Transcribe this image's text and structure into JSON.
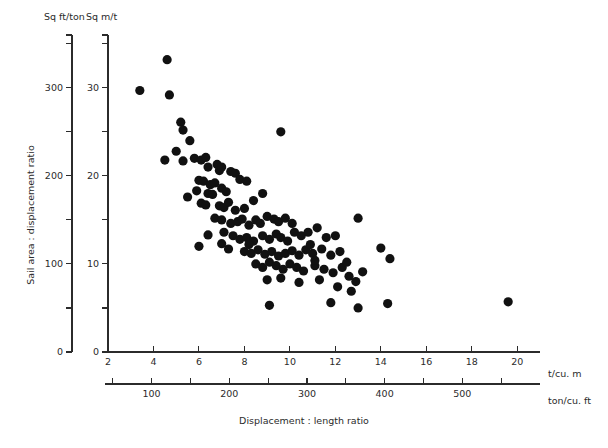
{
  "chart_data": {
    "type": "scatter",
    "title": "",
    "xlabel": "Displacement : length ratio",
    "ylabel": "Sail area : displacement ratio",
    "x_axis_primary": {
      "unit_label": "t/cu. m",
      "ticks": [
        2,
        4,
        6,
        8,
        10,
        12,
        14,
        16,
        18,
        20
      ],
      "tick_labels": [
        "2",
        "4",
        "6",
        "8",
        "10",
        "12",
        "14",
        "16",
        "18",
        "20"
      ],
      "range": [
        2,
        21
      ]
    },
    "x_axis_secondary": {
      "unit_label": "ton/cu. ft",
      "ticks": [
        100,
        200,
        300,
        400,
        500
      ],
      "tick_labels": [
        "100",
        "200",
        "300",
        "400",
        "500"
      ],
      "minor_ticks": [
        50,
        150,
        250,
        350,
        450,
        550
      ]
    },
    "y_axis_primary": {
      "unit_label": "Sq ft/ton",
      "ticks": [
        0,
        100,
        200,
        300
      ],
      "tick_labels": [
        "0",
        "100",
        "200",
        "300"
      ],
      "minor_ticks": [
        50,
        150,
        250,
        350
      ],
      "range": [
        0,
        360
      ]
    },
    "y_axis_secondary": {
      "unit_label": "Sq m/t",
      "ticks": [
        0,
        10,
        20,
        30
      ],
      "tick_labels": [
        "0",
        "10",
        "20",
        "30"
      ],
      "minor_ticks": [
        5,
        15,
        25,
        35
      ],
      "range": [
        0,
        36
      ]
    },
    "grid": false,
    "legend": null,
    "marker": {
      "shape": "circle",
      "color": "#111111",
      "size": 5.4
    },
    "series": [
      {
        "name": "Yachts",
        "points": [
          [
            3.4,
            29.7
          ],
          [
            4.6,
            33.2
          ],
          [
            4.7,
            29.2
          ],
          [
            5.2,
            26.1
          ],
          [
            5.3,
            25.2
          ],
          [
            5.0,
            22.8
          ],
          [
            5.6,
            24.0
          ],
          [
            4.5,
            21.8
          ],
          [
            5.3,
            21.7
          ],
          [
            5.8,
            22.0
          ],
          [
            6.1,
            21.8
          ],
          [
            6.3,
            22.1
          ],
          [
            6.4,
            21.0
          ],
          [
            6.8,
            21.3
          ],
          [
            6.9,
            20.6
          ],
          [
            7.0,
            21.0
          ],
          [
            7.4,
            20.5
          ],
          [
            7.6,
            20.3
          ],
          [
            6.0,
            19.5
          ],
          [
            6.2,
            19.4
          ],
          [
            6.5,
            19.0
          ],
          [
            6.7,
            19.2
          ],
          [
            5.9,
            18.3
          ],
          [
            6.4,
            18.0
          ],
          [
            6.6,
            17.9
          ],
          [
            7.0,
            18.6
          ],
          [
            7.2,
            18.2
          ],
          [
            7.8,
            19.6
          ],
          [
            8.1,
            19.4
          ],
          [
            5.5,
            17.6
          ],
          [
            6.1,
            16.9
          ],
          [
            6.3,
            16.7
          ],
          [
            6.9,
            16.6
          ],
          [
            7.1,
            16.4
          ],
          [
            7.3,
            17.0
          ],
          [
            7.6,
            16.1
          ],
          [
            8.0,
            16.3
          ],
          [
            8.4,
            17.2
          ],
          [
            8.8,
            18.0
          ],
          [
            9.6,
            25.0
          ],
          [
            6.7,
            15.2
          ],
          [
            7.0,
            15.0
          ],
          [
            7.4,
            14.6
          ],
          [
            7.7,
            14.8
          ],
          [
            7.9,
            15.1
          ],
          [
            8.2,
            14.4
          ],
          [
            8.5,
            15.0
          ],
          [
            8.7,
            14.6
          ],
          [
            9.0,
            15.4
          ],
          [
            9.3,
            15.1
          ],
          [
            9.5,
            14.8
          ],
          [
            9.8,
            15.2
          ],
          [
            10.1,
            14.6
          ],
          [
            6.4,
            13.3
          ],
          [
            7.1,
            13.6
          ],
          [
            7.5,
            13.2
          ],
          [
            7.8,
            12.8
          ],
          [
            8.1,
            13.0
          ],
          [
            8.4,
            12.6
          ],
          [
            8.8,
            13.2
          ],
          [
            9.1,
            12.8
          ],
          [
            9.4,
            13.4
          ],
          [
            9.6,
            13.0
          ],
          [
            9.9,
            12.6
          ],
          [
            10.2,
            13.6
          ],
          [
            10.5,
            13.2
          ],
          [
            10.8,
            13.6
          ],
          [
            11.2,
            14.1
          ],
          [
            11.6,
            13.0
          ],
          [
            12.0,
            13.2
          ],
          [
            13.0,
            15.2
          ],
          [
            7.3,
            11.7
          ],
          [
            8.0,
            11.4
          ],
          [
            8.3,
            11.2
          ],
          [
            8.6,
            11.6
          ],
          [
            8.9,
            11.1
          ],
          [
            9.2,
            11.4
          ],
          [
            9.5,
            10.9
          ],
          [
            9.8,
            11.2
          ],
          [
            10.1,
            11.5
          ],
          [
            10.4,
            11.0
          ],
          [
            10.7,
            11.6
          ],
          [
            11.0,
            11.2
          ],
          [
            11.4,
            11.7
          ],
          [
            11.8,
            11.0
          ],
          [
            12.2,
            11.4
          ],
          [
            14.0,
            11.8
          ],
          [
            14.4,
            10.6
          ],
          [
            8.5,
            10.0
          ],
          [
            8.8,
            9.6
          ],
          [
            9.1,
            10.2
          ],
          [
            9.4,
            9.8
          ],
          [
            9.7,
            9.4
          ],
          [
            10.0,
            10.0
          ],
          [
            10.3,
            9.6
          ],
          [
            10.6,
            9.2
          ],
          [
            11.1,
            9.8
          ],
          [
            11.5,
            9.4
          ],
          [
            11.9,
            9.0
          ],
          [
            12.3,
            9.6
          ],
          [
            12.6,
            8.6
          ],
          [
            12.9,
            8.0
          ],
          [
            9.0,
            8.2
          ],
          [
            9.6,
            8.4
          ],
          [
            10.4,
            7.9
          ],
          [
            11.3,
            8.2
          ],
          [
            12.1,
            7.4
          ],
          [
            12.7,
            6.9
          ],
          [
            9.1,
            5.3
          ],
          [
            11.8,
            5.6
          ],
          [
            13.0,
            5.0
          ],
          [
            14.3,
            5.5
          ],
          [
            19.6,
            5.7
          ],
          [
            6.0,
            12.0
          ],
          [
            8.2,
            12.2
          ],
          [
            10.9,
            12.2
          ],
          [
            7.0,
            12.3
          ],
          [
            11.1,
            10.4
          ],
          [
            12.5,
            10.2
          ],
          [
            13.2,
            9.1
          ]
        ]
      }
    ]
  },
  "axis_text": {
    "y_primary_unit": "Sq ft/ton",
    "y_secondary_unit": "Sq m/t",
    "x_primary_unit": "t/cu. m",
    "x_secondary_unit": "ton/cu. ft",
    "y_title": "Sail area : displacement ratio",
    "x_title": "Displacement : length ratio"
  }
}
